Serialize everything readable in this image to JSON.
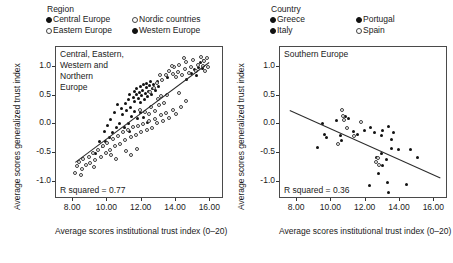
{
  "chart_data": [
    {
      "type": "scatter",
      "panel_id": "left",
      "title": "Central, Eastern,\nWestern and\nNorthern\nEurope",
      "xlabel": "Average scores institutional\ntrust index (0–20)",
      "ylabel": "Average scores generalized trust index",
      "xlim": [
        7.0,
        16.8
      ],
      "ylim": [
        -1.3,
        1.35
      ],
      "xticks": [
        "8.00",
        "10.00",
        "12.00",
        "14.00",
        "16.00"
      ],
      "xtick_values": [
        8,
        10,
        12,
        14,
        16
      ],
      "yticks": [
        "1.0",
        "0.5",
        "0.0",
        "-0.5",
        "-1.0"
      ],
      "ytick_values": [
        1.0,
        0.5,
        0.0,
        -0.5,
        -1.0
      ],
      "grid": false,
      "annotation": "R squared  =  0.77",
      "r_squared": 0.77,
      "legend_title": "Region",
      "legend_position": "above-plot",
      "legend": [
        {
          "label": "Central Europe",
          "marker": "filled"
        },
        {
          "label": "Nordic countries",
          "marker": "open"
        },
        {
          "label": "Eastern Europe",
          "marker": "open"
        },
        {
          "label": "Western Europe",
          "marker": "filled"
        }
      ],
      "fit_line": {
        "x": [
          8.1,
          15.9
        ],
        "y": [
          -0.66,
          1.08
        ]
      },
      "series": [
        {
          "name": "Western Europe",
          "marker": "filled",
          "points": [
            [
              11.05,
              0.36
            ],
            [
              11.2,
              0.44
            ],
            [
              11.3,
              0.52
            ],
            [
              11.35,
              0.3
            ],
            [
              11.5,
              0.47
            ],
            [
              11.55,
              0.58
            ],
            [
              11.6,
              0.4
            ],
            [
              11.68,
              0.52
            ],
            [
              11.72,
              0.63
            ],
            [
              11.8,
              0.45
            ],
            [
              11.85,
              0.55
            ],
            [
              11.9,
              0.66
            ],
            [
              11.95,
              0.38
            ],
            [
              12.0,
              0.5
            ],
            [
              12.05,
              0.6
            ],
            [
              12.1,
              0.69
            ],
            [
              12.15,
              0.43
            ],
            [
              12.2,
              0.54
            ],
            [
              12.25,
              0.64
            ],
            [
              12.3,
              0.72
            ],
            [
              12.35,
              0.48
            ],
            [
              12.4,
              0.58
            ],
            [
              12.45,
              0.68
            ],
            [
              12.5,
              0.75
            ],
            [
              12.55,
              0.52
            ],
            [
              12.6,
              0.62
            ],
            [
              12.7,
              0.7
            ],
            [
              12.8,
              0.6
            ],
            [
              12.9,
              0.74
            ],
            [
              13.0,
              0.66
            ],
            [
              10.8,
              0.28
            ],
            [
              10.6,
              0.34
            ],
            [
              10.4,
              0.2
            ],
            [
              10.9,
              0.18
            ],
            [
              11.1,
              0.25
            ],
            [
              11.4,
              0.14
            ],
            [
              11.6,
              0.22
            ],
            [
              11.75,
              0.1
            ],
            [
              11.9,
              0.2
            ],
            [
              12.1,
              0.12
            ],
            [
              14.6,
              0.78
            ],
            [
              14.9,
              0.88
            ],
            [
              15.1,
              0.96
            ],
            [
              15.3,
              1.0
            ],
            [
              15.45,
              1.08
            ],
            [
              15.55,
              0.98
            ],
            [
              15.6,
              1.12
            ],
            [
              15.2,
              0.86
            ],
            [
              13.5,
              0.82
            ],
            [
              10.2,
              0.08
            ],
            [
              10.0,
              -0.02
            ],
            [
              9.8,
              -0.12
            ],
            [
              9.55,
              -0.3
            ],
            [
              12.35,
              0.04
            ]
          ]
        },
        {
          "name": "Central Europe",
          "marker": "filled",
          "points": [
            [
              10.7,
              0.02
            ],
            [
              10.5,
              -0.06
            ],
            [
              10.3,
              -0.14
            ],
            [
              10.1,
              -0.22
            ],
            [
              11.0,
              -0.06
            ],
            [
              11.2,
              0.02
            ],
            [
              11.3,
              -0.12
            ],
            [
              9.9,
              -0.3
            ],
            [
              9.7,
              -0.38
            ],
            [
              9.3,
              -0.5
            ]
          ]
        },
        {
          "name": "Nordic countries",
          "marker": "open",
          "points": [
            [
              13.2,
              0.78
            ],
            [
              13.4,
              0.86
            ],
            [
              13.6,
              0.94
            ],
            [
              13.8,
              0.88
            ],
            [
              13.9,
              1.0
            ],
            [
              14.0,
              0.82
            ],
            [
              14.1,
              0.92
            ],
            [
              14.2,
              1.04
            ],
            [
              14.35,
              0.86
            ],
            [
              14.5,
              0.96
            ],
            [
              14.6,
              1.08
            ],
            [
              14.75,
              0.9
            ],
            [
              14.9,
              1.0
            ],
            [
              15.0,
              1.12
            ],
            [
              15.15,
              0.94
            ],
            [
              15.3,
              1.04
            ],
            [
              15.45,
              1.18
            ],
            [
              15.55,
              1.02
            ],
            [
              15.65,
              1.1
            ],
            [
              15.7,
              0.94
            ],
            [
              12.9,
              0.72
            ],
            [
              12.7,
              0.64
            ],
            [
              12.5,
              0.56
            ],
            [
              13.05,
              0.86
            ],
            [
              15.8,
              1.16
            ],
            [
              15.85,
              1.0
            ],
            [
              14.45,
              1.16
            ],
            [
              13.75,
              1.02
            ]
          ]
        },
        {
          "name": "Eastern Europe",
          "marker": "open",
          "points": [
            [
              8.2,
              -0.72
            ],
            [
              8.35,
              -0.66
            ],
            [
              8.5,
              -0.78
            ],
            [
              8.6,
              -0.6
            ],
            [
              8.75,
              -0.7
            ],
            [
              8.9,
              -0.56
            ],
            [
              9.0,
              -0.68
            ],
            [
              9.15,
              -0.5
            ],
            [
              9.3,
              -0.62
            ],
            [
              9.45,
              -0.44
            ],
            [
              9.6,
              -0.56
            ],
            [
              9.75,
              -0.38
            ],
            [
              9.9,
              -0.5
            ],
            [
              10.0,
              -0.32
            ],
            [
              10.15,
              -0.44
            ],
            [
              10.3,
              -0.26
            ],
            [
              10.45,
              -0.38
            ],
            [
              10.6,
              -0.2
            ],
            [
              10.75,
              -0.34
            ],
            [
              10.9,
              -0.14
            ],
            [
              11.05,
              -0.28
            ],
            [
              11.2,
              -0.1
            ],
            [
              11.35,
              -0.22
            ],
            [
              11.5,
              -0.04
            ],
            [
              11.65,
              -0.18
            ],
            [
              11.8,
              -0.02
            ],
            [
              11.95,
              -0.14
            ],
            [
              12.1,
              0.0
            ],
            [
              12.3,
              -0.1
            ],
            [
              12.45,
              0.06
            ],
            [
              12.6,
              -0.06
            ],
            [
              12.75,
              0.1
            ],
            [
              12.9,
              0.02
            ],
            [
              13.1,
              0.16
            ],
            [
              13.25,
              0.06
            ],
            [
              13.4,
              0.2
            ],
            [
              13.6,
              0.12
            ],
            [
              13.8,
              0.26
            ],
            [
              14.0,
              0.18
            ],
            [
              14.3,
              0.3
            ],
            [
              12.2,
              0.22
            ],
            [
              12.55,
              0.3
            ],
            [
              12.8,
              0.24
            ],
            [
              13.0,
              0.34
            ],
            [
              13.3,
              0.38
            ],
            [
              12.4,
              0.18
            ],
            [
              11.9,
              0.26
            ],
            [
              14.6,
              0.4
            ],
            [
              8.1,
              -0.84
            ],
            [
              8.45,
              -0.88
            ],
            [
              9.2,
              -0.74
            ],
            [
              10.2,
              -0.54
            ],
            [
              10.5,
              -0.6
            ],
            [
              11.1,
              -0.46
            ],
            [
              11.4,
              -0.54
            ],
            [
              11.7,
              -0.42
            ],
            [
              13.5,
              0.52
            ],
            [
              13.15,
              0.5
            ],
            [
              12.95,
              0.44
            ],
            [
              14.15,
              0.54
            ]
          ]
        }
      ]
    },
    {
      "type": "scatter",
      "panel_id": "right",
      "title": "Southern Europe",
      "xlabel": "Average scores institutional\ntrust index (0–20)",
      "ylabel": "Average scores generalized trust index",
      "xlim": [
        7.0,
        16.8
      ],
      "ylim": [
        -1.3,
        1.35
      ],
      "xticks": [
        "8.00",
        "10.00",
        "12.00",
        "14.00",
        "16.00"
      ],
      "xtick_values": [
        8,
        10,
        12,
        14,
        16
      ],
      "yticks": [
        "1.0",
        "0.5",
        "0.0",
        "-0.5",
        "-1.0"
      ],
      "ytick_values": [
        1.0,
        0.5,
        0.0,
        -0.5,
        -1.0
      ],
      "grid": false,
      "annotation": "R squared  =  0.36",
      "r_squared": 0.36,
      "legend_title": "Country",
      "legend_position": "above-plot",
      "legend": [
        {
          "label": "Greece",
          "marker": "filled"
        },
        {
          "label": "Portugal",
          "marker": "filled"
        },
        {
          "label": "Italy",
          "marker": "filled"
        },
        {
          "label": "Spain",
          "marker": "open"
        }
      ],
      "fit_line": {
        "x": [
          7.6,
          16.4
        ],
        "y": [
          0.26,
          -0.92
        ]
      },
      "series": [
        {
          "name": "Greece",
          "marker": "filled",
          "points": [
            [
              12.9,
              -0.5
            ],
            [
              13.0,
              -0.72
            ],
            [
              13.2,
              -0.62
            ],
            [
              13.25,
              -1.02
            ],
            [
              13.3,
              -1.18
            ],
            [
              12.6,
              -0.58
            ],
            [
              12.75,
              -0.86
            ],
            [
              13.5,
              -0.42
            ],
            [
              14.4,
              -1.04
            ],
            [
              12.2,
              -1.06
            ]
          ]
        },
        {
          "name": "Italy",
          "marker": "filled",
          "points": [
            [
              9.6,
              -0.18
            ],
            [
              9.7,
              -0.22
            ],
            [
              10.5,
              -0.2
            ],
            [
              10.6,
              -0.28
            ],
            [
              11.3,
              -0.12
            ],
            [
              11.5,
              -0.18
            ],
            [
              11.9,
              -0.1
            ],
            [
              12.3,
              -0.06
            ],
            [
              12.5,
              -0.14
            ],
            [
              9.2,
              -0.4
            ],
            [
              9.5,
              0.02
            ],
            [
              10.3,
              0.06
            ],
            [
              11.0,
              0.1
            ],
            [
              10.8,
              0.14
            ]
          ]
        },
        {
          "name": "Portugal",
          "marker": "filled",
          "points": [
            [
              13.0,
              -0.1
            ],
            [
              13.3,
              -0.04
            ],
            [
              13.5,
              -0.26
            ],
            [
              13.9,
              -0.44
            ],
            [
              14.6,
              -0.44
            ],
            [
              15.0,
              -0.58
            ],
            [
              12.9,
              -0.2
            ],
            [
              13.6,
              -0.14
            ]
          ]
        },
        {
          "name": "Spain",
          "marker": "open",
          "points": [
            [
              10.6,
              0.26
            ],
            [
              10.7,
              0.14
            ],
            [
              10.75,
              0.08
            ],
            [
              10.9,
              -0.06
            ],
            [
              11.3,
              -0.2
            ],
            [
              12.6,
              -0.66
            ],
            [
              12.7,
              -0.58
            ],
            [
              11.7,
              0.04
            ],
            [
              10.4,
              -0.34
            ],
            [
              12.8,
              -0.7
            ]
          ]
        }
      ]
    }
  ]
}
